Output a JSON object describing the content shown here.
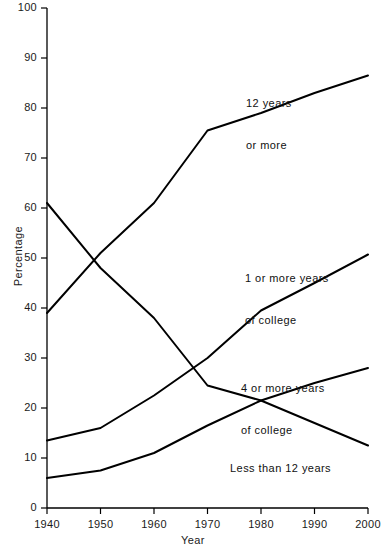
{
  "chart_data": {
    "type": "line",
    "title": "",
    "xlabel": "Year",
    "ylabel": "Percentage",
    "xlim": [
      1940,
      2000
    ],
    "ylim": [
      0,
      100
    ],
    "grid": false,
    "legend_position": "inline-annotations",
    "x": [
      1940,
      1950,
      1960,
      1970,
      1980,
      1990,
      2000
    ],
    "xticks": [
      "1940",
      "1950",
      "1960",
      "1970",
      "1980",
      "1990",
      "2000"
    ],
    "yticks": [
      "0",
      "10",
      "20",
      "30",
      "40",
      "50",
      "60",
      "70",
      "80",
      "90",
      "100"
    ],
    "series": [
      {
        "name": "12 years or more",
        "label_text_line1": "12 years",
        "label_text_line2": "or more",
        "values": [
          39,
          51,
          61,
          75.5,
          79,
          83,
          86.5
        ]
      },
      {
        "name": "Less than 12 years",
        "label_text_line1": "Less than 12 years",
        "label_text_line2": "",
        "values": [
          61,
          48,
          38,
          24.5,
          21.5,
          17,
          12.5
        ]
      },
      {
        "name": "1 or more years of college",
        "label_text_line1": "1 or more years",
        "label_text_line2": "of college",
        "values": [
          13.5,
          16,
          22.5,
          30,
          39.5,
          45,
          50.7
        ]
      },
      {
        "name": "4 or more years of college",
        "label_text_line1": "4 or more years",
        "label_text_line2": "of college",
        "values": [
          6,
          7.5,
          11,
          16.5,
          21.5,
          25,
          28
        ]
      }
    ],
    "line_color": "#000000",
    "axis_color": "#000000",
    "background_color": "#ffffff"
  }
}
